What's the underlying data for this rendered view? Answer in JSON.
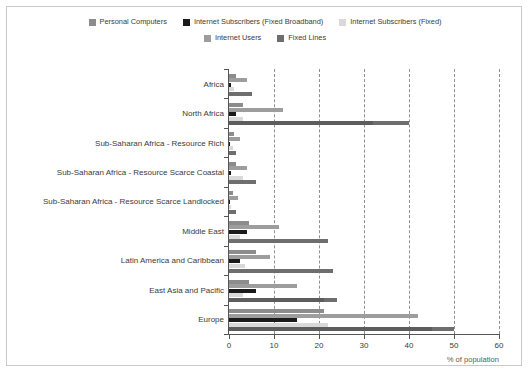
{
  "chart_data": {
    "type": "bar",
    "orientation": "horizontal",
    "title": "",
    "xlabel": "% of population",
    "ylabel": "",
    "xlim": [
      0,
      60
    ],
    "xticks": [
      0,
      10,
      20,
      30,
      40,
      50,
      60
    ],
    "grid": "vertical-dashed",
    "legend_position": "top",
    "categories": [
      "Africa",
      "North Africa",
      "Sub-Saharan Africa - Resource Rich",
      "Sub-Saharan Africa - Resource Scarce Coastal",
      "Sub-Saharan Africa - Resource Scarce Landlocked",
      "Middle East",
      "Latin America and Caribbean",
      "East Asia and Pacific",
      "Europe"
    ],
    "series": [
      {
        "name": "Personal Computers",
        "color": "#8c8c8c",
        "values": [
          1.5,
          3.0,
          1.0,
          1.5,
          0.8,
          4.5,
          6.0,
          4.5,
          21.0
        ]
      },
      {
        "name": "Internet Users",
        "color": "#9d9d9d",
        "values": [
          4.0,
          12.0,
          2.5,
          4.0,
          2.0,
          11.0,
          9.0,
          15.0,
          42.0
        ]
      },
      {
        "name": "Internet Subscribers (Fixed Broadband)",
        "color": "#1a1a1a",
        "values": [
          0.5,
          1.5,
          0.3,
          0.5,
          0.2,
          4.0,
          2.5,
          6.0,
          15.0
        ]
      },
      {
        "name": "Internet Subscribers (Fixed)",
        "color": "#d9d9d9",
        "values": [
          1.2,
          3.0,
          0.8,
          3.0,
          0.5,
          2.5,
          3.5,
          3.0,
          22.0
        ]
      },
      {
        "name": "Fixed Lines",
        "color": "#6e6e6e",
        "values": [
          5.0,
          40.0,
          1.5,
          6.0,
          1.5,
          22.0,
          23.0,
          24.0,
          50.0
        ]
      }
    ],
    "series_secondary_overlay": [
      {
        "name": "Fixed Lines dark segment",
        "applies_to": [
          "North Africa",
          "East Asia and Pacific",
          "Europe"
        ],
        "values": [
          32.0,
          21.0,
          45.0
        ]
      }
    ]
  }
}
